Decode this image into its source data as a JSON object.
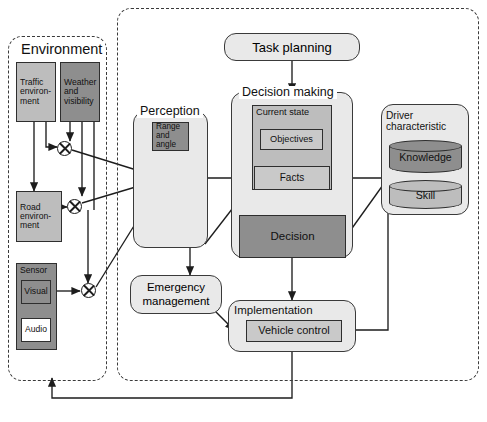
{
  "diagram": {
    "regions": [
      {
        "id": "environment",
        "label": "Environment",
        "style": "dashed"
      },
      {
        "id": "vehicle_system",
        "label": "",
        "style": "dashed"
      }
    ],
    "nodes": {
      "task_planning": {
        "label": "Task planning",
        "shape": "rounded-rect",
        "fill": "light-gray"
      },
      "perception": {
        "label": "Perception",
        "shape": "rounded-rect-group",
        "fill": "light-gray"
      },
      "range_and_angle": {
        "label": "Range and angle",
        "line1": "Range",
        "line2": "and",
        "line3": "angle",
        "shape": "rect",
        "fill": "dark-gray"
      },
      "decision_making": {
        "label": "Decision making",
        "shape": "rounded-rect-group",
        "fill": "light-gray"
      },
      "current_state": {
        "label": "Current state",
        "shape": "rect",
        "fill": "mid-gray"
      },
      "objectives": {
        "label": "Objectives",
        "shape": "rect",
        "fill": "light-gray"
      },
      "facts": {
        "label": "Facts",
        "shape": "rect",
        "fill": "light-gray"
      },
      "decision": {
        "label": "Decision",
        "shape": "rect",
        "fill": "dark-gray"
      },
      "driver_characteristic": {
        "label": "Driver characteristic",
        "line1": "Driver",
        "line2": "characteristic",
        "shape": "rounded-rect-group",
        "fill": "light-gray"
      },
      "knowledge": {
        "label": "Knowledge",
        "shape": "cylinder",
        "fill": "dark-gray"
      },
      "skill": {
        "label": "Skill",
        "shape": "cylinder",
        "fill": "mid-gray"
      },
      "emergency_management": {
        "label": "Emergency management",
        "line1": "Emergency",
        "line2": "management",
        "shape": "rounded-rect",
        "fill": "light-gray"
      },
      "implementation": {
        "label": "Implementation",
        "shape": "rounded-rect-group",
        "fill": "light-gray"
      },
      "vehicle_control": {
        "label": "Vehicle control",
        "shape": "rect",
        "fill": "light-gray"
      },
      "traffic_environment": {
        "label": "Traffic environment",
        "line1": "Traffic",
        "line2": "environ-",
        "line3": "ment",
        "shape": "rect",
        "fill": "mid-gray"
      },
      "weather_and_visibility": {
        "label": "Weather and visibility",
        "line1": "Weather",
        "line2": "and",
        "line3": "visibility",
        "shape": "rect",
        "fill": "dark-gray"
      },
      "road_environment": {
        "label": "Road environment",
        "line1": "Road",
        "line2": "environ-",
        "line3": "ment",
        "shape": "rect",
        "fill": "mid-gray"
      },
      "sensor": {
        "label": "Sensor",
        "shape": "rect",
        "fill": "dark-gray"
      },
      "visual": {
        "label": "Visual",
        "shape": "rect",
        "fill": "dark-gray"
      },
      "audio": {
        "label": "Audio",
        "shape": "rect",
        "fill": "white"
      }
    },
    "summation_nodes": [
      {
        "id": "sum-env-upper",
        "symbol": "⊗"
      },
      {
        "id": "sum-env-lower",
        "symbol": "⊗"
      },
      {
        "id": "sum-sensor",
        "symbol": "⊗"
      },
      {
        "id": "sum-perception-upper",
        "symbol": "⊗"
      },
      {
        "id": "sum-perception-lower",
        "symbol": "⊗"
      }
    ],
    "colors": {
      "stroke": "#2e2e2e",
      "group_fill": "#e9e9e9",
      "light_gray": "#c9c9c9",
      "mid_gray": "#bdbdbd",
      "dark_gray": "#8e8e8e",
      "white": "#ffffff",
      "background": "#ffffff"
    }
  }
}
